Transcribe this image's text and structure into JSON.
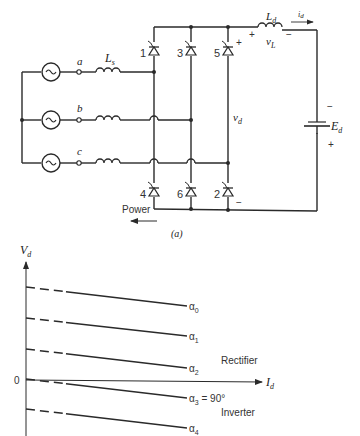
{
  "circuit": {
    "caption": "(a)",
    "phases": [
      {
        "label": "a",
        "y": 72
      },
      {
        "label": "b",
        "y": 120
      },
      {
        "label": "c",
        "y": 163
      }
    ],
    "source_inductor_label": "L",
    "source_inductor_sub": "s",
    "thyristors_top": [
      {
        "num": "1",
        "x": 154
      },
      {
        "num": "3",
        "x": 191
      },
      {
        "num": "5",
        "x": 228
      }
    ],
    "thyristors_bottom": [
      {
        "num": "4",
        "x": 154
      },
      {
        "num": "6",
        "x": 191
      },
      {
        "num": "2",
        "x": 228
      }
    ],
    "dc_inductor_label": "L",
    "dc_inductor_sub": "d",
    "current_label": "i",
    "current_sub": "d",
    "vl_label": "v",
    "vl_sub": "L",
    "vl_plus": "+",
    "vl_minus": "−",
    "vd_label": "v",
    "vd_sub": "d",
    "vd_plus": "+",
    "vd_minus": "−",
    "ed_label": "E",
    "ed_sub": "d",
    "ed_minus": "−",
    "ed_plus": "+",
    "power_label": "Power"
  },
  "graph": {
    "y_axis_label": "V",
    "y_axis_sub": "d",
    "x_axis_label": "I",
    "x_axis_sub": "d",
    "origin_label": "0",
    "region_rectifier": "Rectifier",
    "region_inverter": "Inverter",
    "lines": [
      {
        "name": "α",
        "sub": "0",
        "suffix": "",
        "y0": 287,
        "y1": 306
      },
      {
        "name": "α",
        "sub": "1",
        "suffix": "",
        "y0": 318,
        "y1": 336
      },
      {
        "name": "α",
        "sub": "2",
        "suffix": "",
        "y0": 349,
        "y1": 368
      },
      {
        "name": "α",
        "sub": "3",
        "suffix": " = 90°",
        "y0": 379,
        "y1": 398
      },
      {
        "name": "α",
        "sub": "4",
        "suffix": "",
        "y0": 409,
        "y1": 428
      }
    ]
  },
  "chart_data": {
    "type": "line",
    "xlabel": "Id",
    "ylabel": "Vd",
    "series": [
      {
        "name": "α0",
        "x": [
          0,
          1
        ],
        "values": [
          0.93,
          0.73
        ]
      },
      {
        "name": "α1",
        "x": [
          0,
          1
        ],
        "values": [
          0.62,
          0.44
        ]
      },
      {
        "name": "α2",
        "x": [
          0,
          1
        ],
        "values": [
          0.31,
          0.12
        ]
      },
      {
        "name": "α3 = 90°",
        "x": [
          0,
          1
        ],
        "values": [
          0.0,
          -0.19
        ]
      },
      {
        "name": "α4",
        "x": [
          0,
          1
        ],
        "values": [
          -0.3,
          -0.49
        ]
      }
    ],
    "annotations": [
      "Rectifier",
      "Inverter",
      "0"
    ],
    "grid": false,
    "legend": "inline labels at line ends"
  }
}
